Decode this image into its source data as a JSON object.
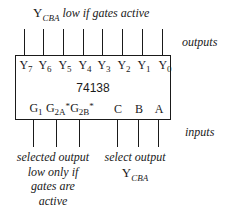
{
  "diagram": {
    "chip": {
      "name": "74138"
    },
    "top_caption": {
      "symbol": "Y",
      "subscript": "CBA",
      "text": "low if gates active"
    },
    "side_labels": {
      "outputs": "outputs",
      "inputs": "inputs"
    },
    "output_pins": [
      {
        "base": "Y",
        "sub": "7"
      },
      {
        "base": "Y",
        "sub": "6"
      },
      {
        "base": "Y",
        "sub": "5"
      },
      {
        "base": "Y",
        "sub": "4"
      },
      {
        "base": "Y",
        "sub": "3"
      },
      {
        "base": "Y",
        "sub": "2"
      },
      {
        "base": "Y",
        "sub": "1"
      },
      {
        "base": "Y",
        "sub": "0"
      }
    ],
    "input_pins": [
      {
        "base": "G",
        "sub": "1",
        "active_low": ""
      },
      {
        "base": "G",
        "sub": "2A",
        "active_low": "*"
      },
      {
        "base": "G",
        "sub": "2B",
        "active_low": "*"
      },
      {
        "base": "C",
        "sub": "",
        "active_low": ""
      },
      {
        "base": "B",
        "sub": "",
        "active_low": ""
      },
      {
        "base": "A",
        "sub": "",
        "active_low": ""
      }
    ],
    "bottom_left_caption": {
      "lines": [
        "selected output",
        "low only if",
        "gates are",
        "active"
      ]
    },
    "bottom_right_caption": {
      "line1": "select output",
      "symbol": "Y",
      "subscript": "CBA"
    }
  }
}
